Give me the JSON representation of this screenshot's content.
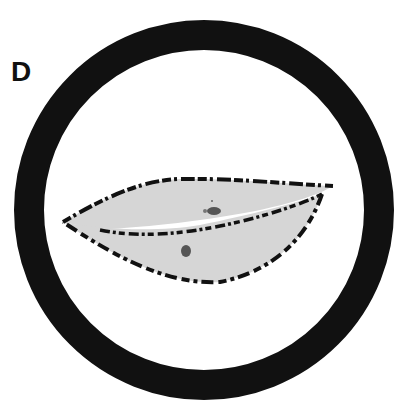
{
  "panel": {
    "label": "D"
  },
  "figure": {
    "colors": {
      "ring": "#111111",
      "fill": "#d6d6d6",
      "outline": "#111111",
      "spot": "#555555",
      "background": "#ffffff"
    }
  }
}
